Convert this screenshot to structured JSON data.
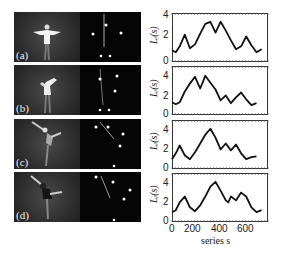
{
  "panels": [
    {
      "label": "(a)"
    },
    {
      "label": "(b)"
    },
    {
      "label": "(c)"
    },
    {
      "label": "(d)"
    }
  ],
  "axes": {
    "ylabel": "L_i(s)",
    "ylabel_display": "Lᵢ(s)",
    "yticks": [
      "0",
      "2",
      "4"
    ],
    "xticks": [
      "0",
      "200",
      "400",
      "600"
    ],
    "xlabel": "series s"
  },
  "chart_data": [
    {
      "type": "line",
      "panel": "(a)",
      "x": [
        0,
        30,
        60,
        100,
        140,
        180,
        220,
        260,
        300,
        340,
        380,
        420,
        460,
        500,
        540,
        580,
        620,
        660,
        700
      ],
      "values": [
        1.2,
        1.0,
        1.6,
        2.8,
        1.4,
        1.8,
        2.9,
        3.9,
        4.1,
        3.0,
        4.1,
        3.2,
        2.2,
        1.3,
        1.6,
        2.6,
        1.7,
        1.0,
        1.3
      ],
      "xlabel": "",
      "ylabel": "L_i(s)",
      "ylim": [
        0,
        5
      ],
      "xlim": [
        0,
        750
      ]
    },
    {
      "type": "line",
      "panel": "(b)",
      "x": [
        0,
        30,
        60,
        100,
        140,
        180,
        220,
        260,
        300,
        340,
        380,
        420,
        460,
        500,
        540,
        580,
        620,
        660
      ],
      "values": [
        1.3,
        1.1,
        1.3,
        2.4,
        3.2,
        3.9,
        2.7,
        4.0,
        3.3,
        2.6,
        1.5,
        2.0,
        1.2,
        1.8,
        2.3,
        1.6,
        1.0,
        1.2
      ],
      "xlabel": "",
      "ylabel": "L_i(s)",
      "ylim": [
        0,
        5
      ],
      "xlim": [
        0,
        750
      ]
    },
    {
      "type": "line",
      "panel": "(c)",
      "x": [
        0,
        30,
        60,
        100,
        140,
        180,
        220,
        260,
        300,
        340,
        380,
        420,
        460,
        500,
        540,
        580,
        620,
        660
      ],
      "values": [
        1.0,
        1.6,
        2.4,
        1.4,
        1.0,
        1.7,
        2.6,
        3.5,
        4.1,
        3.2,
        2.0,
        2.6,
        1.9,
        2.5,
        1.6,
        1.0,
        1.2,
        1.3
      ],
      "xlabel": "",
      "ylabel": "L_i(s)",
      "ylim": [
        0,
        5
      ],
      "xlim": [
        0,
        750
      ]
    },
    {
      "type": "line",
      "panel": "(d)",
      "x": [
        0,
        30,
        60,
        100,
        140,
        180,
        220,
        260,
        300,
        340,
        380,
        420,
        440,
        460,
        500,
        540,
        580,
        620,
        660,
        700
      ],
      "values": [
        1.0,
        1.2,
        2.0,
        2.6,
        1.5,
        1.1,
        1.7,
        2.6,
        3.6,
        4.1,
        3.2,
        2.2,
        2.0,
        2.6,
        2.2,
        3.0,
        2.6,
        1.5,
        1.0,
        1.2
      ],
      "xlabel": "series s",
      "ylabel": "L_i(s)",
      "ylim": [
        0,
        5
      ],
      "xlim": [
        0,
        750
      ],
      "xticks": [
        0,
        200,
        400,
        600
      ]
    }
  ]
}
